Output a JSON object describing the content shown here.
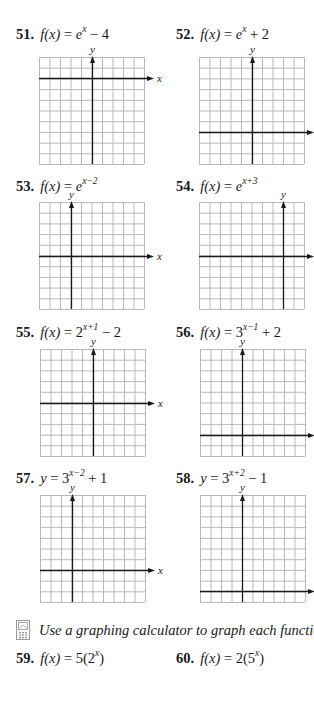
{
  "problems": [
    {
      "num": "51.",
      "lhs": "f(x)",
      "base": "e",
      "exp": "x",
      "rest": " − 4"
    },
    {
      "num": "52.",
      "lhs": "f(x)",
      "base": "e",
      "exp": "x",
      "rest": " + 2"
    },
    {
      "num": "53.",
      "lhs": "f(x)",
      "base": "e",
      "exp": "x−2",
      "rest": ""
    },
    {
      "num": "54.",
      "lhs": "f(x)",
      "base": "e",
      "exp": "x+3",
      "rest": ""
    },
    {
      "num": "55.",
      "lhs": "f(x)",
      "base": "2",
      "exp": "x+1",
      "rest": " − 2"
    },
    {
      "num": "56.",
      "lhs": "f(x)",
      "base": "3",
      "exp": "x−1",
      "rest": " + 2"
    },
    {
      "num": "57.",
      "lhs": "y",
      "base": "3",
      "exp": "x−2",
      "rest": " + 1"
    },
    {
      "num": "58.",
      "lhs": "y",
      "base": "3",
      "exp": "x+2",
      "rest": " − 1"
    }
  ],
  "graphs": [
    {
      "id": "51",
      "left": 39,
      "top": 57,
      "cols": 10,
      "rows": 10,
      "y_axis_col": 5,
      "x_axis_row": 2
    },
    {
      "id": "52",
      "left": 199,
      "top": 57,
      "cols": 10,
      "rows": 10,
      "y_axis_col": 5,
      "x_axis_row": 7
    },
    {
      "id": "53",
      "left": 39,
      "top": 202,
      "cols": 10,
      "rows": 10,
      "y_axis_col": 3,
      "x_axis_row": 5
    },
    {
      "id": "54",
      "left": 199,
      "top": 202,
      "cols": 10,
      "rows": 10,
      "y_axis_col": 8,
      "x_axis_row": 5
    },
    {
      "id": "55",
      "left": 40,
      "top": 349,
      "cols": 10,
      "rows": 10,
      "y_axis_col": 5,
      "x_axis_row": 5
    },
    {
      "id": "56",
      "left": 200,
      "top": 349,
      "cols": 10,
      "rows": 10,
      "y_axis_col": 4,
      "x_axis_row": 8
    },
    {
      "id": "57",
      "left": 40,
      "top": 495,
      "cols": 10,
      "rows": 10,
      "y_axis_col": 3,
      "x_axis_row": 7
    },
    {
      "id": "58",
      "left": 200,
      "top": 495,
      "cols": 10,
      "rows": 10,
      "y_axis_col": 4,
      "x_axis_row": 9
    }
  ],
  "axis_labels": {
    "x": "x",
    "y": "y"
  },
  "calculator_note": {
    "icon": "graphing-calculator-icon",
    "text": "Use a graphing calculator to graph each function."
  },
  "calc_problems": [
    {
      "num": "59.",
      "lhs": "f(x)",
      "pre": " = 5(2",
      "exp": "x",
      "post": ")"
    },
    {
      "num": "60.",
      "lhs": "f(x)",
      "pre": " = 2(5",
      "exp": "x",
      "post": ")"
    }
  ],
  "colors": {
    "grid": "#b8b8b8",
    "axis": "#1a1a1a",
    "text": "#1a1a1a"
  }
}
